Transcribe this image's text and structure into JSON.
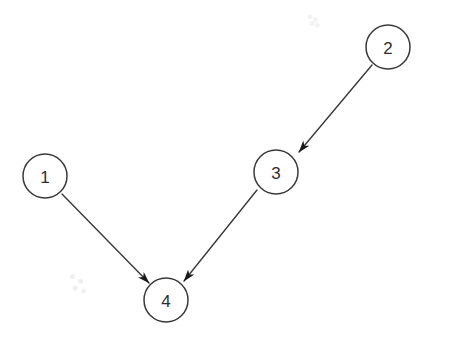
{
  "figure": {
    "kind": "directed-graph-diagram",
    "width": 455,
    "height": 342,
    "background_color": "#ffffff",
    "stroke_color": "#3a3a3a",
    "label_color": "#2e2e2e",
    "arrowhead_color": "#1a1a1a",
    "node_fill": "#ffffff",
    "node_radius": 22,
    "node_stroke_width": 1.5,
    "edge_stroke_width": 1.4
  },
  "graph": {
    "nodes": [
      {
        "id": "1",
        "label": "1",
        "cx": 45,
        "cy": 176,
        "r": 22
      },
      {
        "id": "2",
        "label": "2",
        "cx": 388,
        "cy": 47,
        "r": 22
      },
      {
        "id": "3",
        "label": "3",
        "cx": 276,
        "cy": 172,
        "r": 22
      },
      {
        "id": "4",
        "label": "4",
        "cx": 166,
        "cy": 300,
        "r": 22
      }
    ],
    "edges": [
      {
        "id": "e-2-3",
        "from": "2",
        "to": "3",
        "x1": 372,
        "y1": 65,
        "x2": 299,
        "y2": 152,
        "directed": true
      },
      {
        "id": "e-1-4",
        "from": "1",
        "to": "4",
        "x1": 62,
        "y1": 194,
        "x2": 149,
        "y2": 283,
        "directed": true
      },
      {
        "id": "e-3-4",
        "from": "3",
        "to": "4",
        "x1": 257,
        "y1": 190,
        "x2": 184,
        "y2": 281,
        "directed": true
      }
    ]
  },
  "artifacts": [
    {
      "id": "smudge-lower-left",
      "x": 62,
      "y": 268,
      "w": 30,
      "h": 28,
      "opacity": 0.1
    },
    {
      "id": "smudge-upper-right",
      "x": 303,
      "y": 12,
      "w": 20,
      "h": 16,
      "opacity": 0.07
    }
  ]
}
